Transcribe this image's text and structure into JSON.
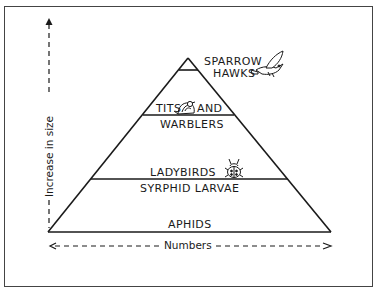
{
  "diagram": {
    "type": "ecological pyramid of numbers",
    "levels": [
      {
        "label": "SPARROW\nHAWKS",
        "line1": "SPARROW",
        "line2": "HAWKS",
        "icon": "hawk-icon"
      },
      {
        "label": "TITS AND WARBLERS",
        "line1a": "TITS",
        "line1b": "AND",
        "line2": "WARBLERS",
        "icon": "bird-icon"
      },
      {
        "label": "LADYBIRDS",
        "line1": "LADYBIRDS",
        "icon": "ladybird-icon"
      },
      {
        "label": "SYRPHID LARVAE",
        "line1": "SYRPHID LARVAE"
      },
      {
        "label": "APHIDS",
        "line1": "APHIDS"
      }
    ],
    "axes": {
      "y_label": "Increase in size",
      "x_label": "Numbers"
    },
    "colors": {
      "ink": "#1a1a1a",
      "background": "#ffffff",
      "frame": "#444444"
    }
  }
}
